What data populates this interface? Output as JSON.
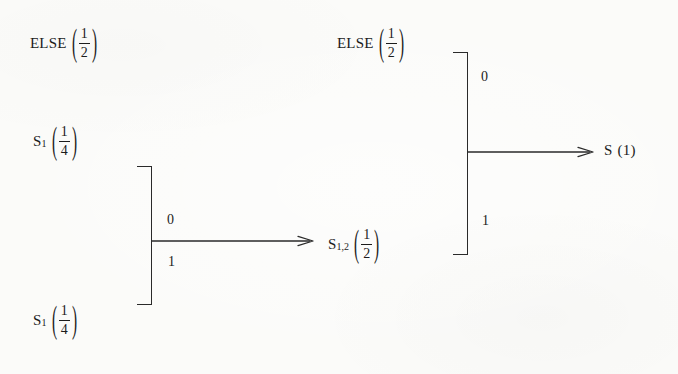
{
  "diagram": {
    "type": "state-merge-flow",
    "background_color": "#fbfbf9",
    "ink_color": "#1c1c1c",
    "nodes": [
      {
        "id": "else-left",
        "label": "ELSE",
        "value_numerator": "1",
        "value_denominator": "2",
        "subscript": ""
      },
      {
        "id": "s1-top",
        "label": "S",
        "subscript": "1",
        "value_numerator": "1",
        "value_denominator": "4"
      },
      {
        "id": "s1-bottom",
        "label": "S",
        "subscript": "1",
        "value_numerator": "1",
        "value_denominator": "4"
      },
      {
        "id": "s12-middle",
        "label": "S",
        "subscript": "1,2",
        "value_numerator": "1",
        "value_denominator": "2"
      },
      {
        "id": "else-right",
        "label": "ELSE",
        "subscript": "",
        "value_numerator": "1",
        "value_denominator": "2"
      },
      {
        "id": "s-final",
        "label": "S",
        "subscript": "",
        "value_plain": "(1)"
      }
    ],
    "edge_labels": {
      "left_bracket_top": "0",
      "left_bracket_bottom": "1",
      "right_bracket_top": "0",
      "right_bracket_bottom": "1"
    },
    "parens": {
      "open": "(",
      "close": ")"
    }
  }
}
